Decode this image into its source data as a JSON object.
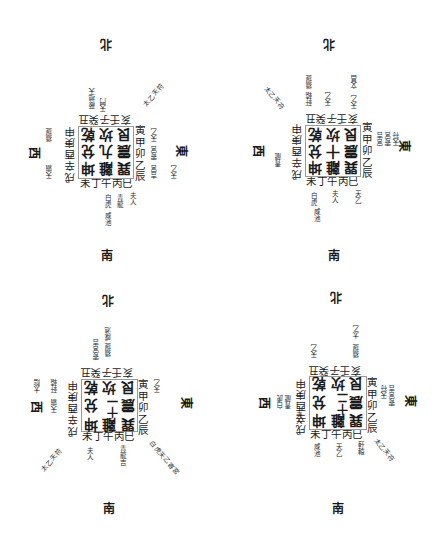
{
  "page": {
    "colors": {
      "ink": "#1a1a1a",
      "paper": "#ffffff",
      "frame": "#9a9a9a"
    }
  },
  "diagrams": [
    {
      "directions": {
        "north": "北",
        "south": "南",
        "east": "東",
        "west": "西"
      },
      "center_grid": [
        [
          "乾",
          "坎",
          "艮"
        ],
        [
          "兌",
          "九",
          "震"
        ],
        [
          "坤",
          "離",
          "巽"
        ]
      ],
      "ring": {
        "top": "亥壬子癸丑",
        "bottom": "未丁午丙巳",
        "left": "戌辛酉庚申",
        "right": "寅甲卯乙辰"
      },
      "notes": {
        "nw": "蔽地天",
        "n1": "天門",
        "ne": "太乙天符",
        "e1": "天乙",
        "e2": "寄宮",
        "e3": "吉宮",
        "w1": "攝提",
        "w2": "天霸",
        "s1": "白虎",
        "s2": "青龍",
        "s3": "夫人",
        "s4": "咸池",
        "se1": "天乙"
      }
    },
    {
      "directions": {
        "north": "北",
        "south": "南",
        "east": "東",
        "west": "西"
      },
      "center_grid": [
        [
          "乾",
          "坎",
          "艮"
        ],
        [
          "兌",
          "十",
          "震"
        ],
        [
          "坤",
          "離",
          "巽"
        ]
      ],
      "ring": {
        "top": "亥壬子癸丑",
        "bottom": "未丁午丙巳",
        "left": "戌辛酉庚申",
        "right": "寅甲卯乙辰"
      },
      "notes": {
        "nw": "太乙天符",
        "n1": "攝提",
        "n2": "軒轅",
        "n3": "天乙",
        "ne1": "文昌",
        "ne2": "天乙",
        "e1": "宮吉",
        "e2": "寄宮",
        "e3": "天符",
        "w1": "青龍",
        "s1": "白虎",
        "s2": "夫人",
        "s3": "天乙",
        "s4": "咸池"
      }
    },
    {
      "directions": {
        "north": "北",
        "south": "南",
        "east": "東",
        "west": "西"
      },
      "center_grid": [
        [
          "乾",
          "坎",
          "艮"
        ],
        [
          "兌",
          "十一",
          "震"
        ],
        [
          "坤",
          "離",
          "巽"
        ]
      ],
      "ring": {
        "top": "亥壬子癸丑",
        "bottom": "未丁午丙巳",
        "left": "戌辛酉庚申",
        "right": "寅甲卯乙辰"
      },
      "notes": {
        "n1": "咸池",
        "n2": "攝提",
        "n3": "寄宮吉",
        "ne": "天乙",
        "w1": "天霸",
        "w2": "軒轅",
        "w3": "太陰",
        "sw": "太乙天符",
        "s1": "夫人",
        "s2": "青龍吉",
        "se": "白虎天乙寄宮"
      }
    },
    {
      "directions": {
        "north": "北",
        "south": "南",
        "east": "東",
        "west": "西"
      },
      "center_grid": [
        [
          "乾",
          "坎",
          "艮"
        ],
        [
          "兌",
          "十二",
          "震"
        ],
        [
          "坤",
          "離",
          "巽"
        ]
      ],
      "ring": {
        "top": "亥壬子癸丑",
        "bottom": "未丁午丙巳",
        "left": "戌辛酉庚申",
        "right": "寅甲卯乙辰"
      },
      "notes": {
        "n1": "太乙",
        "n2": "攝提",
        "n3": "天乙",
        "e1": "天符",
        "e2": "寄宮吉",
        "w1": "白虎",
        "w2": "青龍",
        "w3": "夫人",
        "s1": "咸池",
        "s2": "天乙",
        "s3": "軒轅",
        "se": "太乙天符"
      }
    }
  ]
}
